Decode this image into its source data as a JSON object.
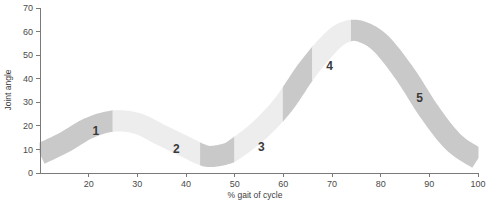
{
  "chart_data": {
    "type": "area",
    "title": "",
    "xlabel": "% gait of cycle",
    "ylabel": "Joint angle",
    "xlim": [
      10,
      100
    ],
    "ylim": [
      0,
      70
    ],
    "grid": false,
    "legend": "none",
    "x_ticks": [
      20,
      30,
      40,
      50,
      60,
      70,
      80,
      90,
      100
    ],
    "y_ticks": [
      0,
      10,
      20,
      30,
      40,
      50,
      60,
      70
    ],
    "band_thickness": 9,
    "series": [
      {
        "name": "Joint angle band (centerline)",
        "x": [
          10,
          15,
          20,
          25,
          30,
          35,
          40,
          43,
          45,
          48,
          50,
          55,
          60,
          65,
          70,
          73,
          76,
          80,
          85,
          90,
          95,
          100
        ],
        "values": [
          8,
          13,
          19,
          22,
          21,
          16,
          11,
          8,
          7,
          8,
          10,
          18,
          29,
          44,
          56,
          60,
          60,
          55,
          42,
          26,
          13,
          6
        ]
      }
    ],
    "segments": [
      {
        "name": "phase-1",
        "x_start": 10,
        "x_end": 25,
        "shade": "#c9c9c9"
      },
      {
        "name": "phase-2",
        "x_start": 25,
        "x_end": 43,
        "shade": "#ededed"
      },
      {
        "name": "phase-3",
        "x_start": 43,
        "x_end": 50,
        "shade": "#c9c9c9"
      },
      {
        "name": "phase-4",
        "x_start": 50,
        "x_end": 60,
        "shade": "#ededed"
      },
      {
        "name": "phase-5",
        "x_start": 60,
        "x_end": 66,
        "shade": "#c9c9c9"
      },
      {
        "name": "phase-6",
        "x_start": 66,
        "x_end": 74,
        "shade": "#ededed"
      },
      {
        "name": "phase-7",
        "x_start": 74,
        "x_end": 100,
        "shade": "#c9c9c9"
      }
    ],
    "annotations": [
      {
        "label": "1",
        "x": 21.5,
        "y": 17.5
      },
      {
        "label": "2",
        "x": 38.0,
        "y": 10.0
      },
      {
        "label": "3",
        "x": 55.5,
        "y": 10.5
      },
      {
        "label": "4",
        "x": 69.5,
        "y": 45.0
      },
      {
        "label": "5",
        "x": 88.0,
        "y": 31.5
      }
    ]
  },
  "axes": {
    "y_title": "Joint angle",
    "x_title": "% gait of cycle"
  },
  "colors": {
    "band_dark": "#c9c9c9",
    "band_light": "#ededed",
    "axis": "#7a7a7a",
    "text": "#3c3c3c",
    "background": "#ffffff"
  }
}
